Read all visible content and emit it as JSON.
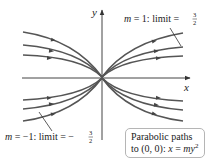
{
  "figure": {
    "axes": {
      "x_label": "x",
      "y_label": "y"
    },
    "annotations": {
      "top_right": {
        "m_value": "m = 1: limit = ",
        "fraction_num": "3",
        "fraction_den": "2"
      },
      "bottom_left": {
        "m_value": "m = −1: limit = −",
        "fraction_num": "3",
        "fraction_den": "2"
      }
    },
    "caption": {
      "line1": "Parabolic paths",
      "line2_prefix": "to (0, 0): ",
      "line2_var_x": "x",
      "line2_eq": " = ",
      "line2_var_my": "my",
      "line2_exp": "2"
    },
    "colors": {
      "curve": "#555555",
      "axis": "#444444",
      "box_border": "#b5b5b5"
    },
    "paths": [
      {
        "family": "m > 0 (right opening)",
        "count": 3,
        "direction": "toward origin"
      },
      {
        "family": "m < 0 (left opening)",
        "count": 3,
        "direction": "toward origin"
      }
    ]
  }
}
